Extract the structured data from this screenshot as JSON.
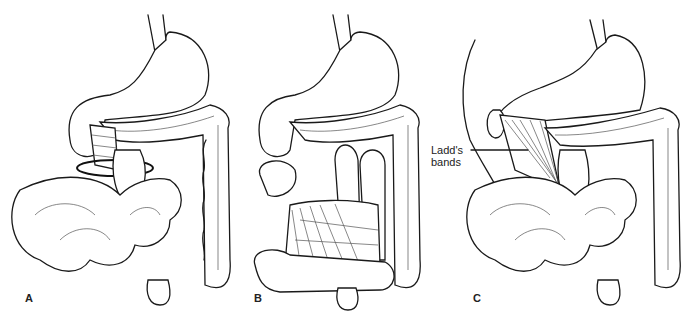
{
  "figure": {
    "panels": [
      {
        "id": "A",
        "label": "A"
      },
      {
        "id": "B",
        "label": "B"
      },
      {
        "id": "C",
        "label": "C"
      }
    ],
    "callouts": [
      {
        "panel": "C",
        "line1": "Ladd's",
        "line2": "bands"
      }
    ],
    "colors": {
      "line": "#1a1a1a",
      "background": "#ffffff"
    }
  }
}
